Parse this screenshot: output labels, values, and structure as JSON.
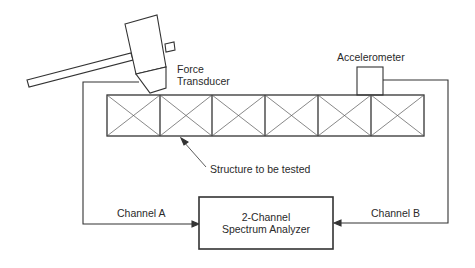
{
  "diagram": {
    "labels": {
      "force_transducer": [
        "Force",
        "Transducer"
      ],
      "accelerometer": "Accelerometer",
      "structure": "Structure to be tested",
      "channel_a": "Channel A",
      "channel_b": "Channel B",
      "analyzer": [
        "2-Channel",
        "Spectrum Analyzer"
      ]
    },
    "structure": {
      "cells": 6
    },
    "colors": {
      "line": "#333333",
      "background": "#ffffff"
    }
  }
}
